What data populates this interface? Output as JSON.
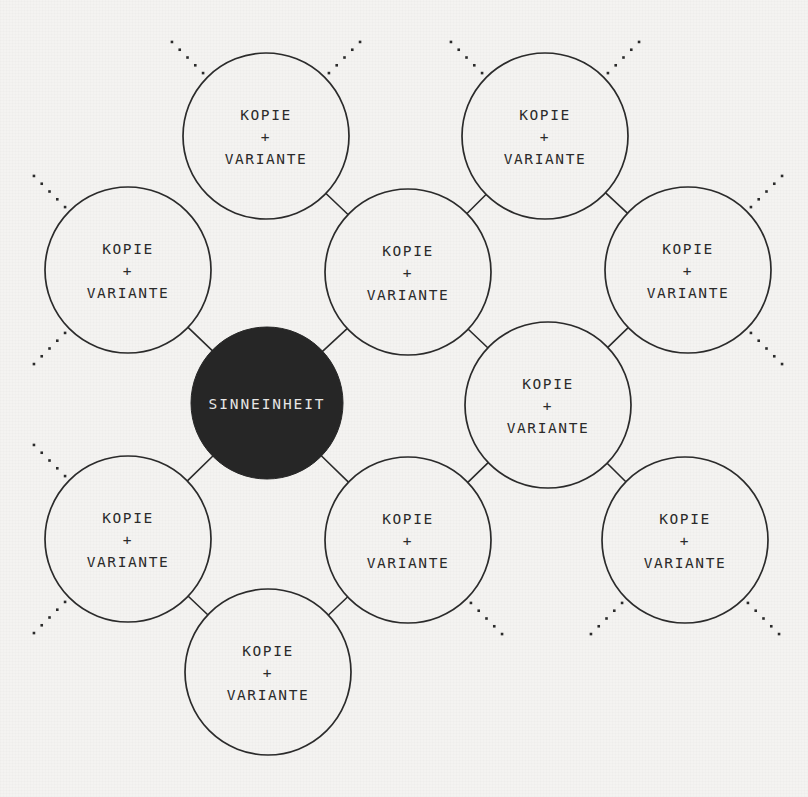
{
  "diagram": {
    "type": "radial-node-diagram",
    "language": "de",
    "background_color": "#f4f3f1",
    "stroke_color": "#2b2b2b",
    "core": {
      "id": "core",
      "label": "SINNEINHEIT",
      "fill": "#262626",
      "text_color": "#e9e8e6",
      "cx": 267,
      "cy": 403,
      "r": 76
    },
    "node_label": {
      "line1": "KOPIE",
      "line2": "+",
      "line3": "VARIANTE"
    },
    "nodes": [
      {
        "id": "node-1",
        "line1": "KOPIE",
        "line2": "+",
        "line3": "VARIANTE",
        "cx": 266,
        "cy": 136,
        "r": 83
      },
      {
        "id": "node-2",
        "line1": "KOPIE",
        "line2": "+",
        "line3": "VARIANTE",
        "cx": 545,
        "cy": 136,
        "r": 83
      },
      {
        "id": "node-3",
        "line1": "KOPIE",
        "line2": "+",
        "line3": "VARIANTE",
        "cx": 128,
        "cy": 270,
        "r": 83
      },
      {
        "id": "node-4",
        "line1": "KOPIE",
        "line2": "+",
        "line3": "VARIANTE",
        "cx": 408,
        "cy": 272,
        "r": 83
      },
      {
        "id": "node-5",
        "line1": "KOPIE",
        "line2": "+",
        "line3": "VARIANTE",
        "cx": 688,
        "cy": 270,
        "r": 83
      },
      {
        "id": "node-6",
        "line1": "KOPIE",
        "line2": "+",
        "line3": "VARIANTE",
        "cx": 548,
        "cy": 405,
        "r": 83
      },
      {
        "id": "node-7",
        "line1": "KOPIE",
        "line2": "+",
        "line3": "VARIANTE",
        "cx": 128,
        "cy": 539,
        "r": 83
      },
      {
        "id": "node-8",
        "line1": "KOPIE",
        "line2": "+",
        "line3": "VARIANTE",
        "cx": 408,
        "cy": 540,
        "r": 83
      },
      {
        "id": "node-9",
        "line1": "KOPIE",
        "line2": "+",
        "line3": "VARIANTE",
        "cx": 685,
        "cy": 540,
        "r": 83
      },
      {
        "id": "node-10",
        "line1": "KOPIE",
        "line2": "+",
        "line3": "VARIANTE",
        "cx": 268,
        "cy": 672,
        "r": 83
      }
    ],
    "connectors": [
      {
        "from": "core",
        "to": "node-3"
      },
      {
        "from": "core",
        "to": "node-4"
      },
      {
        "from": "core",
        "to": "node-7"
      },
      {
        "from": "core",
        "to": "node-8"
      },
      {
        "from": "node-1",
        "to": "node-4"
      },
      {
        "from": "node-2",
        "to": "node-4"
      },
      {
        "from": "node-2",
        "to": "node-5"
      },
      {
        "from": "node-4",
        "to": "node-6"
      },
      {
        "from": "node-5",
        "to": "node-6"
      },
      {
        "from": "node-6",
        "to": "node-9"
      },
      {
        "from": "node-7",
        "to": "node-10"
      },
      {
        "from": "node-8",
        "to": "node-10"
      },
      {
        "from": "node-8",
        "to": "node-6"
      }
    ],
    "dotted_stubs": [
      {
        "node": "node-1",
        "angle_deg": 225
      },
      {
        "node": "node-1",
        "angle_deg": 315
      },
      {
        "node": "node-2",
        "angle_deg": 225
      },
      {
        "node": "node-2",
        "angle_deg": 315
      },
      {
        "node": "node-3",
        "angle_deg": 225
      },
      {
        "node": "node-3",
        "angle_deg": 135
      },
      {
        "node": "node-5",
        "angle_deg": 315
      },
      {
        "node": "node-5",
        "angle_deg": 45
      },
      {
        "node": "node-7",
        "angle_deg": 225
      },
      {
        "node": "node-7",
        "angle_deg": 135
      },
      {
        "node": "node-8",
        "angle_deg": 45
      },
      {
        "node": "node-9",
        "angle_deg": 135
      },
      {
        "node": "node-9",
        "angle_deg": 45
      }
    ]
  }
}
